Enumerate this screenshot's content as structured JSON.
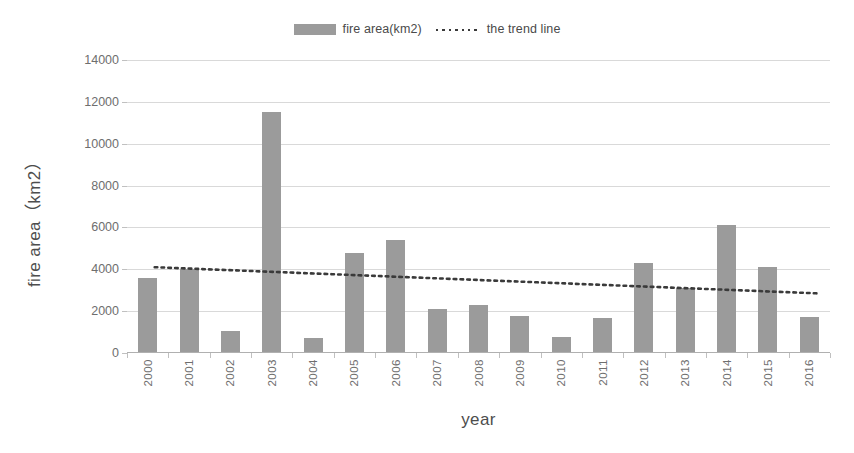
{
  "legend": {
    "position": "top-center",
    "entries": [
      {
        "label": "fire area(km2)",
        "icon": "bar-swatch-icon",
        "color": "#9b9b9b"
      },
      {
        "label": "the trend line",
        "icon": "dotted-line-swatch-icon",
        "color": "#3a3a3a"
      }
    ]
  },
  "axes": {
    "x_title": "year",
    "y_title": "fire area（km2）"
  },
  "chart_data": {
    "type": "bar",
    "title": "",
    "subtitle": "",
    "xlabel": "year",
    "ylabel": "fire area（km2）",
    "categories": [
      "2000",
      "2001",
      "2002",
      "2003",
      "2004",
      "2005",
      "2006",
      "2007",
      "2008",
      "2009",
      "2010",
      "2011",
      "2012",
      "2013",
      "2014",
      "2015",
      "2016"
    ],
    "series": [
      {
        "name": "fire area(km2)",
        "type": "bar",
        "color": "#9b9b9b",
        "values": [
          3600,
          4000,
          1050,
          11500,
          700,
          4800,
          5400,
          2100,
          2300,
          1750,
          750,
          1650,
          4300,
          3100,
          6100,
          4100,
          1720
        ]
      },
      {
        "name": "the trend line",
        "type": "line",
        "style": "dotted",
        "color": "#3a3a3a",
        "endpoints": {
          "start_value": 4100,
          "end_value": 2850
        }
      }
    ],
    "ylim": [
      0,
      14000
    ],
    "yticks": [
      0,
      2000,
      4000,
      6000,
      8000,
      10000,
      12000,
      14000
    ],
    "ytick_labels": [
      "0",
      "2000",
      "4000",
      "6000",
      "8000",
      "10000",
      "12000",
      "14000"
    ],
    "grid": "horizontal",
    "legend_position": "top-center"
  }
}
